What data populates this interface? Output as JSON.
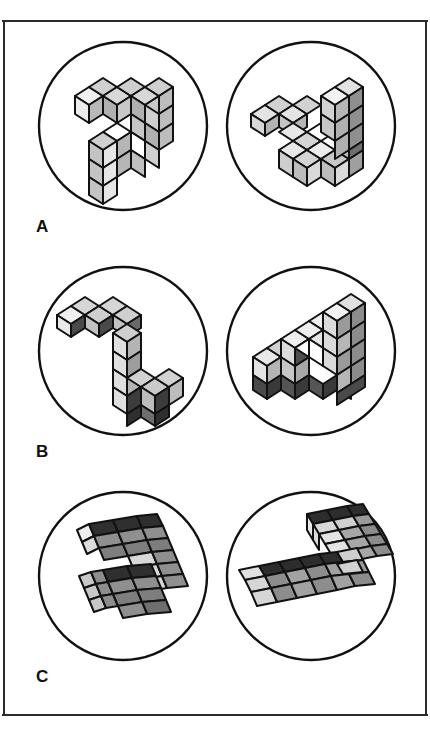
{
  "figure": {
    "kind": "mental-rotation-cube-figure",
    "background_color": "#ffffff",
    "border_color": "#2b2b2b",
    "rows": [
      {
        "label": "A",
        "left_circle_name": "item-a-left-shape",
        "right_circle_name": "item-a-right-shape"
      },
      {
        "label": "B",
        "left_circle_name": "item-b-left-shape",
        "right_circle_name": "item-b-right-shape"
      },
      {
        "label": "C",
        "left_circle_name": "item-c-left-shape",
        "right_circle_name": "item-c-right-shape"
      }
    ],
    "palette": {
      "outline": "#111111",
      "circle_stroke": "#111111",
      "face_top_light": "#f0f0f0",
      "face_top_mid": "#d8d8d8",
      "face_front_light": "#cccccc",
      "face_front_mid": "#b0b0b0",
      "face_side_dark": "#8a8a8a",
      "face_dark": "#5a5a5a",
      "face_darkest": "#3a3a3a",
      "face_white": "#ffffff"
    }
  }
}
